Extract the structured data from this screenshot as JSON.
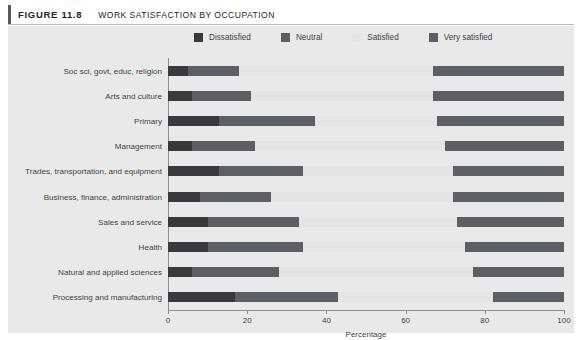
{
  "header": {
    "figure_number": "FIGURE 11.8",
    "title": "WORK SATISFACTION BY OCCUPATION"
  },
  "colors": {
    "panel_background": "#e9e9e9",
    "dissatisfied": "#3a3a3c",
    "neutral": "#5e5f62",
    "satisfied": "#e4e4e4",
    "very_satisfied": "#5e5f62",
    "axis": "#8e8f92",
    "text": "#3f3f41",
    "rule": "#58595b"
  },
  "chart_data": {
    "type": "bar",
    "orientation": "horizontal",
    "stacked": true,
    "title": "WORK SATISFACTION BY OCCUPATION",
    "xlabel": "Percentage",
    "ylabel": "",
    "xlim": [
      0,
      100
    ],
    "xticks": [
      0,
      20,
      40,
      60,
      80,
      100
    ],
    "xtick_labels": [
      "0",
      "20",
      "40",
      "60",
      "80",
      "100"
    ],
    "grid": false,
    "legend_position": "top",
    "categories": [
      "Soc sci, govt, educ, religion",
      "Arts and culture",
      "Primary",
      "Management",
      "Trades, transportation, and equipment",
      "Business, finance, administration",
      "Sales and service",
      "Health",
      "Natural and applied sciences",
      "Processing and manufacturing"
    ],
    "series": [
      {
        "name": "Dissatisfied",
        "color": "#3a3a3c",
        "values": [
          5,
          6,
          13,
          6,
          13,
          8,
          10,
          10,
          6,
          17
        ]
      },
      {
        "name": "Neutral",
        "color": "#5e5f62",
        "values": [
          13,
          15,
          24,
          16,
          21,
          18,
          23,
          24,
          22,
          26
        ]
      },
      {
        "name": "Satisfied",
        "color": "#e4e4e4",
        "values": [
          49,
          46,
          31,
          48,
          38,
          46,
          40,
          41,
          49,
          39
        ]
      },
      {
        "name": "Very satisfied",
        "color": "#5e5f62",
        "values": [
          33,
          33,
          32,
          30,
          28,
          28,
          27,
          25,
          23,
          18
        ]
      }
    ]
  }
}
